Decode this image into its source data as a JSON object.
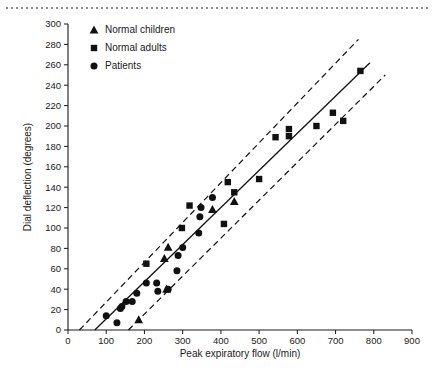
{
  "figure": {
    "decor": {
      "top_rule": "dotted-rule"
    }
  },
  "chart_data": {
    "type": "scatter",
    "title": "",
    "xlabel": "Peak expiratory flow (l/min)",
    "ylabel": "Dial deflection (degrees)",
    "xlim": [
      0,
      900
    ],
    "ylim": [
      0,
      300
    ],
    "xticks": [
      0,
      100,
      200,
      300,
      400,
      500,
      600,
      700,
      800,
      900
    ],
    "yticks": [
      0,
      20,
      40,
      60,
      80,
      100,
      120,
      140,
      160,
      180,
      200,
      220,
      240,
      260,
      280,
      300
    ],
    "grid": false,
    "legend_position": "top-left",
    "legend": [
      {
        "label": "Normal children",
        "marker": "triangle"
      },
      {
        "label": "Normal adults",
        "marker": "square"
      },
      {
        "label": "Patients",
        "marker": "circle"
      }
    ],
    "series": [
      {
        "name": "Normal children",
        "marker": "triangle",
        "color": "#111111",
        "points": [
          [
            185,
            10
          ],
          [
            258,
            40
          ],
          [
            252,
            70
          ],
          [
            262,
            81
          ],
          [
            378,
            118
          ],
          [
            435,
            126
          ]
        ]
      },
      {
        "name": "Normal adults",
        "marker": "square",
        "color": "#111111",
        "points": [
          [
            205,
            65
          ],
          [
            298,
            100
          ],
          [
            318,
            122
          ],
          [
            408,
            104
          ],
          [
            418,
            145
          ],
          [
            435,
            135
          ],
          [
            500,
            148
          ],
          [
            543,
            189
          ],
          [
            578,
            190
          ],
          [
            578,
            197
          ],
          [
            650,
            200
          ],
          [
            693,
            213
          ],
          [
            720,
            205
          ],
          [
            765,
            254
          ]
        ]
      },
      {
        "name": "Patients",
        "marker": "circle",
        "color": "#111111",
        "points": [
          [
            100,
            14
          ],
          [
            128,
            7
          ],
          [
            137,
            21
          ],
          [
            141,
            23
          ],
          [
            152,
            28
          ],
          [
            168,
            28
          ],
          [
            180,
            36
          ],
          [
            205,
            46
          ],
          [
            232,
            46
          ],
          [
            235,
            38
          ],
          [
            262,
            40
          ],
          [
            285,
            58
          ],
          [
            288,
            73
          ],
          [
            300,
            81
          ],
          [
            342,
            95
          ],
          [
            345,
            111
          ],
          [
            348,
            120
          ],
          [
            378,
            130
          ]
        ]
      }
    ],
    "lines": [
      {
        "name": "regression-line",
        "style": "solid",
        "x": [
          70,
          790
        ],
        "y": [
          0,
          262
        ]
      },
      {
        "name": "upper-limit-line",
        "style": "dashed",
        "x": [
          30,
          760
        ],
        "y": [
          0,
          285
        ]
      },
      {
        "name": "lower-limit-line",
        "style": "dashed",
        "x": [
          158,
          830
        ],
        "y": [
          0,
          250
        ]
      }
    ]
  }
}
